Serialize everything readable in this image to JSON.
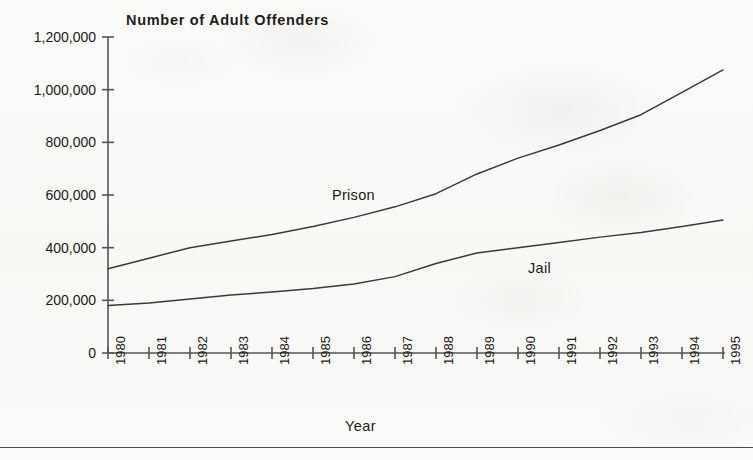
{
  "figure": {
    "title": "Number of Adult Offenders",
    "x_axis_title": "Year",
    "bottom_rule": true,
    "background_color": "#fbfbf9",
    "line_color": "#3a3a3a",
    "axis_color": "#555555",
    "text_color": "#1a1a1a"
  },
  "chart_data": {
    "type": "line",
    "title": "Number of Adult Offenders",
    "xlabel": "Year",
    "ylabel": "",
    "categories": [
      1980,
      1981,
      1982,
      1983,
      1984,
      1985,
      1986,
      1987,
      1988,
      1989,
      1990,
      1991,
      1992,
      1993,
      1994,
      1995
    ],
    "x": [
      "1980",
      "1981",
      "1982",
      "1983",
      "1984",
      "1985",
      "1986",
      "1987",
      "1988",
      "1989",
      "1990",
      "1991",
      "1992",
      "1993",
      "1994",
      "1995"
    ],
    "xlim": [
      1980,
      1995
    ],
    "ylim": [
      0,
      1200000
    ],
    "ytick_values": [
      0,
      200000,
      400000,
      600000,
      800000,
      1000000,
      1200000
    ],
    "ytick_labels": [
      "0",
      "200,000",
      "400,000",
      "600,000",
      "800,000",
      "1,000,000",
      "1,200,000"
    ],
    "grid": false,
    "legend": "inline-labels",
    "series": [
      {
        "name": "Prison",
        "label_position": "inline",
        "values": [
          320000,
          360000,
          400000,
          425000,
          450000,
          480000,
          515000,
          555000,
          605000,
          680000,
          740000,
          790000,
          845000,
          905000,
          990000,
          1075000
        ]
      },
      {
        "name": "Jail",
        "label_position": "inline",
        "values": [
          180000,
          190000,
          205000,
          220000,
          232000,
          245000,
          262000,
          290000,
          340000,
          380000,
          400000,
          420000,
          440000,
          458000,
          480000,
          505000
        ]
      }
    ],
    "annotations": [
      {
        "text": "Prison",
        "for_series": "Prison"
      },
      {
        "text": "Jail",
        "for_series": "Jail"
      }
    ]
  }
}
